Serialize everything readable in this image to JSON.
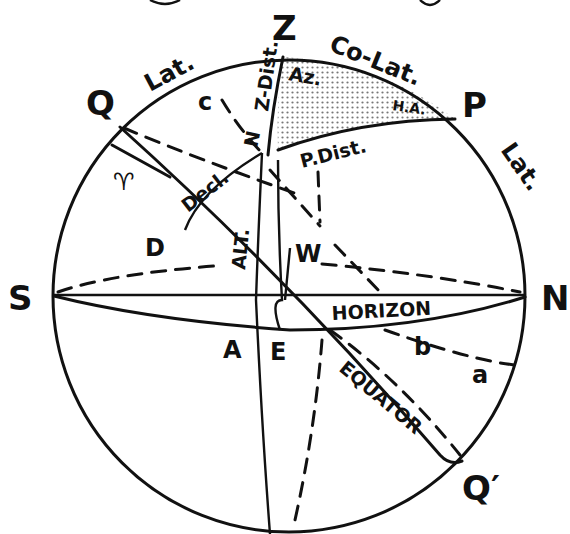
{
  "diagram": {
    "title_fragment": "...",
    "shade_color": "#bfbfbf",
    "line_color": "#111111",
    "points": {
      "zenith": "Z",
      "pole": "P",
      "north": "N",
      "south": "S",
      "equator_top": "Q",
      "equator_bottom": "Q′",
      "star": "X",
      "west": "W",
      "east": "E",
      "a_point": "A",
      "d_point": "D",
      "aries": "♈",
      "small_a": "a",
      "small_b": "b",
      "small_c": "c"
    },
    "arc_labels": {
      "lat_left": "Lat.",
      "co_lat": "Co-Lat.",
      "lat_right": "Lat.",
      "azimuth": "Az.",
      "hour_angle": "H.A.",
      "zenith_distance": "Z-Dist.",
      "zenith_n": "N",
      "polar_distance": "P.Dist.",
      "declination": "Decl.",
      "altitude": "ALT.",
      "horizon": "HORIZON",
      "equator": "EQUATOR"
    }
  }
}
